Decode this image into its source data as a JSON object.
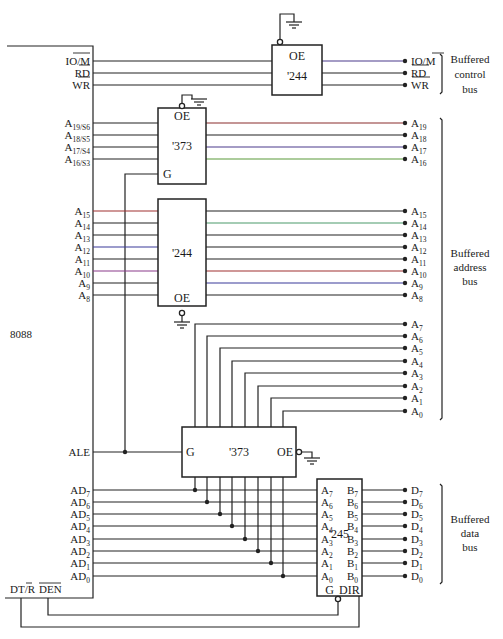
{
  "cpu": {
    "name": "8088"
  },
  "control": {
    "inputs": [
      "IO/M",
      "RD",
      "WR"
    ],
    "chip": {
      "type": "'244",
      "pin": "OE"
    },
    "outputs": [
      "IO/M",
      "RD",
      "WR"
    ],
    "bus_label": [
      "Buffered",
      "control",
      "bus"
    ]
  },
  "address_high": {
    "inputs": [
      [
        "A",
        "19/S6"
      ],
      [
        "A",
        "18/S5"
      ],
      [
        "A",
        "17/S4"
      ],
      [
        "A",
        "16/S3"
      ]
    ],
    "chip": {
      "type": "'373",
      "oe": "OE",
      "g": "G"
    },
    "outputs": [
      [
        "A",
        "19"
      ],
      [
        "A",
        "18"
      ],
      [
        "A",
        "17"
      ],
      [
        "A",
        "16"
      ]
    ]
  },
  "address_mid": {
    "inputs": [
      [
        "A",
        "15"
      ],
      [
        "A",
        "14"
      ],
      [
        "A",
        "13"
      ],
      [
        "A",
        "12"
      ],
      [
        "A",
        "11"
      ],
      [
        "A",
        "10"
      ],
      [
        "A",
        "9"
      ],
      [
        "A",
        "8"
      ]
    ],
    "chip": {
      "type": "'244",
      "oe": "OE"
    },
    "outputs": [
      [
        "A",
        "15"
      ],
      [
        "A",
        "14"
      ],
      [
        "A",
        "13"
      ],
      [
        "A",
        "12"
      ],
      [
        "A",
        "11"
      ],
      [
        "A",
        "10"
      ],
      [
        "A",
        "9"
      ],
      [
        "A",
        "8"
      ]
    ]
  },
  "address_low": {
    "outputs": [
      [
        "A",
        "7"
      ],
      [
        "A",
        "6"
      ],
      [
        "A",
        "5"
      ],
      [
        "A",
        "4"
      ],
      [
        "A",
        "3"
      ],
      [
        "A",
        "2"
      ],
      [
        "A",
        "1"
      ],
      [
        "A",
        "0"
      ]
    ],
    "chip": {
      "type": "'373",
      "g": "G",
      "oe": "OE"
    },
    "ale": "ALE"
  },
  "address_bus_label": [
    "Buffered",
    "address",
    "bus"
  ],
  "data": {
    "inputs": [
      [
        "AD",
        "7"
      ],
      [
        "AD",
        "6"
      ],
      [
        "AD",
        "5"
      ],
      [
        "AD",
        "4"
      ],
      [
        "AD",
        "3"
      ],
      [
        "AD",
        "2"
      ],
      [
        "AD",
        "1"
      ],
      [
        "AD",
        "0"
      ]
    ],
    "chip": {
      "type": "'245",
      "a_pins": [
        [
          "A",
          "7"
        ],
        [
          "A",
          "6"
        ],
        [
          "A",
          "5"
        ],
        [
          "A",
          "4"
        ],
        [
          "A",
          "3"
        ],
        [
          "A",
          "2"
        ],
        [
          "A",
          "1"
        ],
        [
          "A",
          "0"
        ]
      ],
      "b_pins": [
        [
          "B",
          "7"
        ],
        [
          "B",
          "6"
        ],
        [
          "B",
          "5"
        ],
        [
          "B",
          "4"
        ],
        [
          "B",
          "3"
        ],
        [
          "B",
          "2"
        ],
        [
          "B",
          "1"
        ],
        [
          "B",
          "0"
        ]
      ],
      "g": "G",
      "dir": "DIR"
    },
    "outputs": [
      [
        "D",
        "7"
      ],
      [
        "D",
        "6"
      ],
      [
        "D",
        "5"
      ],
      [
        "D",
        "4"
      ],
      [
        "D",
        "3"
      ],
      [
        "D",
        "2"
      ],
      [
        "D",
        "1"
      ],
      [
        "D",
        "0"
      ]
    ],
    "bus_label": [
      "Buffered",
      "data",
      "bus"
    ]
  },
  "bottom_signals": {
    "dtr": "DT/R",
    "den": "DEN"
  }
}
